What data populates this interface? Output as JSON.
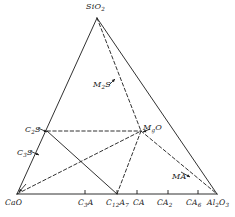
{
  "figure": {
    "type": "ternary-phase-diagram",
    "system": "CaO-SiO2-Al2O3-MgO",
    "background_color": "#ffffff",
    "line_color": "#1a1a1a",
    "label_color": "#1a1a1a"
  },
  "apices": {
    "top": {
      "name": "silica-apex",
      "text_main": "SiO",
      "sub": "2",
      "x": 97,
      "y": 18
    },
    "bottom_left": {
      "name": "lime-apex",
      "text_main": "CaO",
      "sub": "",
      "x": 17,
      "y": 194
    },
    "bottom_right": {
      "name": "alumina-apex",
      "text_main": "Al",
      "sub": "2",
      "text_mid": "O",
      "sub2": "3",
      "x": 217,
      "y": 194
    }
  },
  "labels": [
    {
      "id": "sio2",
      "name": "label-sio2",
      "html": "SiO<sub>2</sub>",
      "left": 86,
      "top": 3,
      "arrow": false
    },
    {
      "id": "m2s",
      "name": "label-m2s",
      "html": "M<sub>2</sub>S",
      "left": 93,
      "top": 81,
      "arrow": true
    },
    {
      "id": "mgo",
      "name": "label-mgo",
      "html": "M<sub>g</sub>O",
      "left": 143,
      "top": 124,
      "arrow": true
    },
    {
      "id": "c2s",
      "name": "label-c2s",
      "html": "C<sub>2</sub>S",
      "left": 25,
      "top": 126,
      "arrow": true
    },
    {
      "id": "c3s",
      "name": "label-c3s",
      "html": "C<sub>3</sub>S",
      "left": 17,
      "top": 149,
      "arrow": true
    },
    {
      "id": "ma",
      "name": "label-ma",
      "html": "MA",
      "left": 172,
      "top": 173,
      "arrow": true
    },
    {
      "id": "cao",
      "name": "label-cao",
      "html": "CaO",
      "left": 5,
      "top": 199,
      "arrow": false
    },
    {
      "id": "c3a",
      "name": "label-c3a",
      "html": "C<sub>3</sub>A",
      "left": 78,
      "top": 199,
      "arrow": false
    },
    {
      "id": "c12a7",
      "name": "label-c12a7",
      "html": "C<sub>12</sub>A<sub>7</sub>",
      "left": 106,
      "top": 199,
      "arrow": false
    },
    {
      "id": "ca",
      "name": "label-ca",
      "html": "CA",
      "left": 133,
      "top": 199,
      "arrow": false
    },
    {
      "id": "ca2",
      "name": "label-ca2",
      "html": "CA<sub>2</sub>",
      "left": 157,
      "top": 199,
      "arrow": false
    },
    {
      "id": "ca6",
      "name": "label-ca6",
      "html": "CA<sub>6</sub>",
      "left": 186,
      "top": 199,
      "arrow": false
    },
    {
      "id": "al2o3",
      "name": "label-al2o3",
      "html": "Al<sub>2</sub>O<sub>3</sub>",
      "left": 207,
      "top": 199,
      "arrow": false
    }
  ],
  "points": {
    "sio2": {
      "name": "vertex-sio2",
      "x": 97,
      "y": 18
    },
    "cao": {
      "name": "vertex-cao",
      "x": 17,
      "y": 194
    },
    "al2o3": {
      "name": "vertex-al2o3",
      "x": 217,
      "y": 194
    },
    "mgo": {
      "name": "vertex-mgo",
      "x": 141,
      "y": 131
    },
    "c2s": {
      "name": "vertex-c2s",
      "x": 47,
      "y": 131
    },
    "c3s": {
      "name": "vertex-c3s",
      "x": 38,
      "y": 154
    },
    "c3a": {
      "name": "tick-c3a",
      "x": 85,
      "y": 194
    },
    "c12a7": {
      "name": "tick-c12a7",
      "x": 117,
      "y": 194
    },
    "ca": {
      "name": "tick-ca",
      "x": 137,
      "y": 194
    },
    "ca2": {
      "name": "tick-ca2",
      "x": 168,
      "y": 194
    },
    "ca6": {
      "name": "tick-ca6",
      "x": 198,
      "y": 194
    }
  },
  "solid_lines": [
    {
      "name": "edge-cao-sio2",
      "x1": 17,
      "y1": 194,
      "x2": 97,
      "y2": 18
    },
    {
      "name": "edge-sio2-al2o3",
      "x1": 97,
      "y1": 18,
      "x2": 217,
      "y2": 194
    },
    {
      "name": "edge-cao-al2o3",
      "x1": 17,
      "y1": 194,
      "x2": 217,
      "y2": 194
    },
    {
      "name": "tie-c2s-c12a7",
      "x1": 47,
      "y1": 131,
      "x2": 117,
      "y2": 194
    }
  ],
  "dashed_lines": [
    {
      "name": "tie-sio2-mgo",
      "x1": 97,
      "y1": 18,
      "x2": 141,
      "y2": 131
    },
    {
      "name": "tie-mgo-c12a7",
      "x1": 141,
      "y1": 131,
      "x2": 117,
      "y2": 194
    },
    {
      "name": "tie-c2s-mgo",
      "x1": 47,
      "y1": 131,
      "x2": 141,
      "y2": 131
    },
    {
      "name": "tie-cao-mgo",
      "x1": 17,
      "y1": 194,
      "x2": 141,
      "y2": 131
    },
    {
      "name": "tie-mgo-al2o3",
      "x1": 141,
      "y1": 131,
      "x2": 217,
      "y2": 194
    }
  ],
  "tick_marks": [
    {
      "name": "tick-mark-c3a",
      "x": 85
    },
    {
      "name": "tick-mark-c12a7",
      "x": 117
    },
    {
      "name": "tick-mark-ca",
      "x": 137
    },
    {
      "name": "tick-mark-ca2",
      "x": 168
    },
    {
      "name": "tick-mark-ca6",
      "x": 198
    }
  ],
  "pointer_arrows": [
    {
      "name": "arrow-m2s",
      "x1": 109,
      "y1": 85,
      "x2": 115,
      "y2": 79
    },
    {
      "name": "arrow-mgo",
      "x1": 150,
      "y1": 129,
      "x2": 143,
      "y2": 132
    },
    {
      "name": "arrow-c2s",
      "x1": 38,
      "y1": 128,
      "x2": 47,
      "y2": 132
    },
    {
      "name": "arrow-c3s",
      "x1": 30,
      "y1": 151,
      "x2": 39,
      "y2": 155
    },
    {
      "name": "arrow-ma",
      "x1": 181,
      "y1": 172,
      "x2": 190,
      "y2": 177
    },
    {
      "name": "arrow-cao",
      "x1": 26,
      "y1": 184,
      "x2": 19,
      "y2": 192
    }
  ]
}
